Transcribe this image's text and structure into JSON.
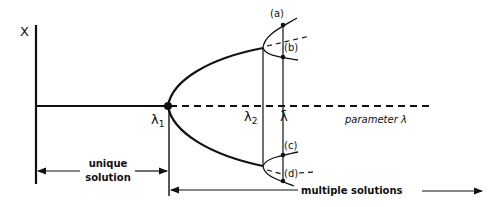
{
  "diagram": {
    "type": "bifurcation-diagram",
    "axis": {
      "y_label": "X",
      "x_label": "parameter λ"
    },
    "points": {
      "lambda1": {
        "label": "λ",
        "sub": "1"
      },
      "lambda2": {
        "label": "λ",
        "sub": "2"
      },
      "lambda_bar": {
        "label": "λ̄"
      }
    },
    "branch_labels": {
      "a": "(a)",
      "b": "(b)",
      "c": "(c)",
      "d": "(d)"
    },
    "ranges": {
      "unique_line1": "unique",
      "unique_line2": "solution",
      "multiple": "multiple solutions"
    },
    "colors": {
      "ink": "#111111",
      "background": "#ffffff"
    }
  }
}
